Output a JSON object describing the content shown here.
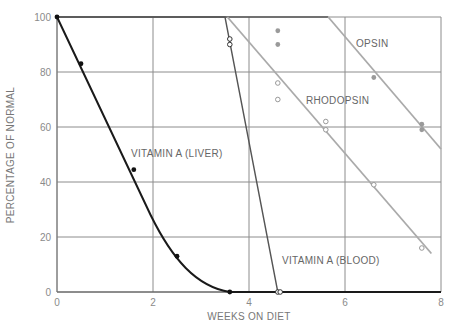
{
  "chart_data": {
    "type": "line",
    "title": "",
    "xlabel": "WEEKS ON DIET",
    "ylabel": "PERCENTAGE OF NORMAL",
    "xlim": [
      0,
      8
    ],
    "ylim": [
      0,
      100
    ],
    "x_ticks": [
      "0",
      "2",
      "4",
      "6",
      "8"
    ],
    "y_ticks": [
      "0",
      "20",
      "40",
      "60",
      "80",
      "100"
    ],
    "grid": true,
    "legend": "inline labels",
    "series": [
      {
        "name": "VITAMIN A (LIVER)",
        "color": "#1a1a1a",
        "marker": "filled-circle",
        "points": [
          [
            0,
            100
          ],
          [
            0.5,
            83
          ],
          [
            1.6,
            44.5
          ],
          [
            2.5,
            13
          ],
          [
            3.6,
            0
          ]
        ],
        "line": [
          [
            0,
            100
          ],
          [
            3.6,
            0
          ],
          [
            8,
            0
          ]
        ]
      },
      {
        "name": "VITAMIN A (BLOOD)",
        "color": "#555555",
        "marker": "open-circle",
        "points": [
          [
            3.6,
            92
          ],
          [
            3.6,
            90
          ],
          [
            4.6,
            0
          ],
          [
            4.65,
            0
          ]
        ],
        "line": [
          [
            0,
            100
          ],
          [
            3.5,
            100
          ],
          [
            4.6,
            0
          ]
        ]
      },
      {
        "name": "RHODOPSIN",
        "color": "#aaaaaa",
        "marker": "open-circle",
        "points": [
          [
            4.6,
            76
          ],
          [
            4.6,
            70
          ],
          [
            5.6,
            62
          ],
          [
            5.6,
            59
          ],
          [
            6.6,
            39
          ],
          [
            7.6,
            16
          ]
        ],
        "line": [
          [
            3.55,
            100
          ],
          [
            7.8,
            14
          ]
        ]
      },
      {
        "name": "OPSIN",
        "color": "#aaaaaa",
        "marker": "filled-circle",
        "points": [
          [
            4.6,
            95
          ],
          [
            4.6,
            90
          ],
          [
            6.6,
            78
          ],
          [
            7.6,
            61
          ],
          [
            7.6,
            59
          ]
        ],
        "line": [
          [
            5.65,
            100
          ],
          [
            8,
            52
          ]
        ]
      }
    ]
  },
  "labels": {
    "xlabel": "WEEKS ON DIET",
    "ylabel": "PERCENTAGE OF NORMAL",
    "liver": "VITAMIN A (LIVER)",
    "blood": "VITAMIN A (BLOOD)",
    "rhodopsin": "RHODOPSIN",
    "opsin": "OPSIN"
  }
}
